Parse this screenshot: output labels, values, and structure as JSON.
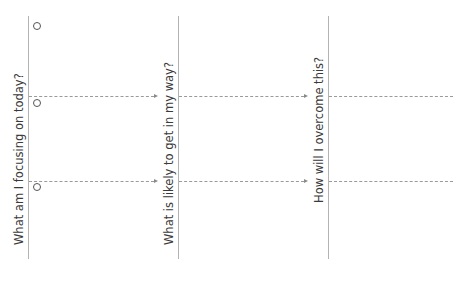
{
  "columns": [
    {
      "label": "What am I focusing on today?"
    },
    {
      "label": "What is likely to get in my way?"
    },
    {
      "label": "How will I overcome this?"
    }
  ],
  "rows": 3,
  "colors": {
    "line": "#b3b3b3",
    "dash": "#9a9a9a",
    "text": "#3a3a3a"
  }
}
